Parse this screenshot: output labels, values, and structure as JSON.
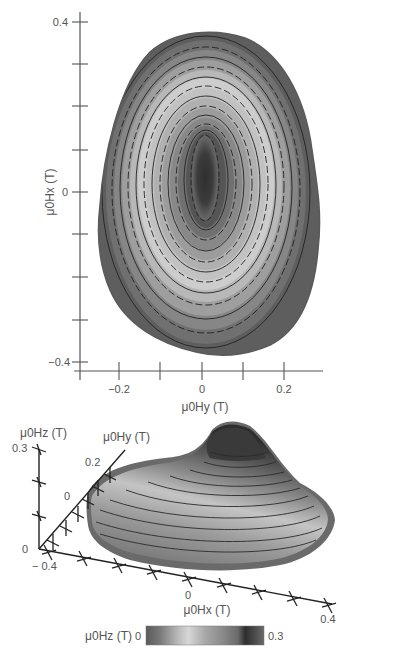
{
  "chart_data": [
    {
      "type": "heatmap",
      "subtype": "contour-map",
      "title": "",
      "xlabel": "μ0Hy (T)",
      "ylabel": "μ0Hx (T)",
      "xlim": [
        -0.3,
        0.3
      ],
      "ylim": [
        -0.42,
        0.42
      ],
      "x_tick_labels": [
        "-0.2",
        "0",
        "0.2"
      ],
      "x_ticks": [
        -0.2,
        -0.1,
        0,
        0.1,
        0.2
      ],
      "y_tick_labels": [
        "0.4",
        "0",
        "-0.4"
      ],
      "y_ticks": [
        0.4,
        0.3,
        0.2,
        0.1,
        0,
        -0.1,
        -0.2,
        -0.3,
        -0.4
      ],
      "grid": false,
      "description": "Egg-shaped contour map of field magnitude; dark peak core centered near (0, 0.05) elongated along Hx; concentric iso-lines with grayscale bands",
      "region_extent": {
        "hy": [
          -0.24,
          0.26
        ],
        "hx": [
          -0.38,
          0.36
        ]
      },
      "peak": {
        "hy": 0.0,
        "hx": 0.05
      }
    },
    {
      "type": "surface-3d",
      "title": "",
      "xlabel": "μ0Hx (T)",
      "ylabel": "μ0Hy (T)",
      "zlabel": "μ0Hz (T)",
      "x_tick_labels": [
        "-0.4",
        "0",
        "0.4"
      ],
      "y_tick_labels": [
        "0",
        "0.2"
      ],
      "z_tick_labels": [
        "0",
        "0.3"
      ],
      "zlim": [
        0,
        0.3
      ],
      "description": "3D surface of μ0Hz over the (Hx, Hy) plane with contour lines; peak near 0.3 T at the far end"
    }
  ],
  "colorbar": {
    "label": "μ0Hz (T)",
    "min_label": "0",
    "max_label": "0.3",
    "colors": [
      "#5a5a5a",
      "#6e6e6e",
      "#8a8a8a",
      "#a8a8a8",
      "#c8c8c8",
      "#d8d8d8",
      "#b8b8b8",
      "#9a9a9a",
      "#808080",
      "#6a6a6a",
      "#3a3a3a",
      "#505050",
      "#6a6a6a"
    ]
  },
  "labels": {
    "top_x_axis": "μ0Hy (T)",
    "top_y_axis": "μ0Hx (T)",
    "top_x_ticks": [
      "−0.2",
      "0",
      "0.2"
    ],
    "top_y_ticks": [
      "0.4",
      "0",
      "−0.4"
    ],
    "bottom_z_axis": "μ0Hz (T)",
    "bottom_y_axis": "μ0Hy (T)",
    "bottom_x_axis": "μ0Hx (T)",
    "bottom_z_ticks": [
      "0.3",
      "0"
    ],
    "bottom_y_ticks": [
      "0.2",
      "0"
    ],
    "bottom_x_ticks": [
      "− 0.4",
      "0",
      "0.4"
    ]
  }
}
